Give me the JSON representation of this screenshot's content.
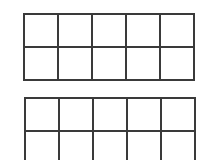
{
  "frames": [
    {
      "id": "frame-1",
      "rows": 2,
      "cols": 5,
      "filled_cells": []
    },
    {
      "id": "frame-2",
      "rows": 2,
      "cols": 5,
      "filled_cells": []
    }
  ],
  "colors": {
    "background": "#ffffff",
    "grid_line": "#3a3a3a"
  }
}
